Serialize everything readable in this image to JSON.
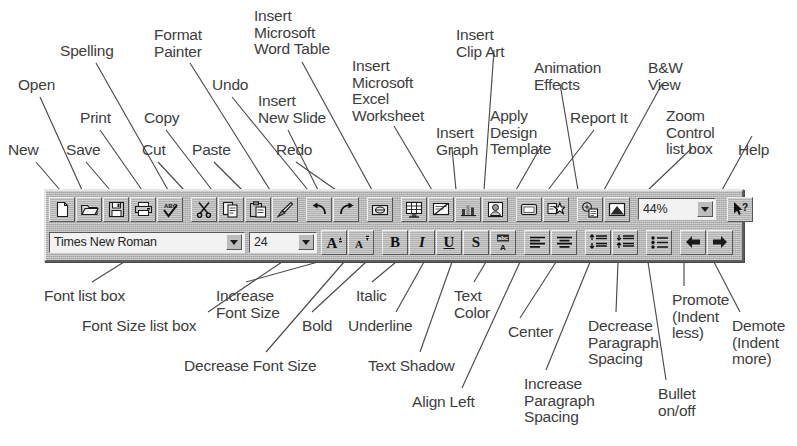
{
  "figure": {
    "line_color": "#4a4a4a",
    "text_color": "#3d3d3d",
    "toolbar_face": "#b9b9b9"
  },
  "callouts_top": [
    {
      "id": "new",
      "label": "New",
      "x": 8,
      "y": 142,
      "align": "left"
    },
    {
      "id": "open",
      "label": "Open",
      "x": 18,
      "y": 77,
      "align": "left"
    },
    {
      "id": "save",
      "label": "Save",
      "x": 66,
      "y": 142,
      "align": "left"
    },
    {
      "id": "print",
      "label": "Print",
      "x": 80,
      "y": 110,
      "align": "left"
    },
    {
      "id": "spelling",
      "label": "Spelling",
      "x": 60,
      "y": 43,
      "align": "left"
    },
    {
      "id": "cut",
      "label": "Cut",
      "x": 142,
      "y": 142,
      "align": "left"
    },
    {
      "id": "copy",
      "label": "Copy",
      "x": 144,
      "y": 110,
      "align": "left"
    },
    {
      "id": "paste",
      "label": "Paste",
      "x": 192,
      "y": 142,
      "align": "left"
    },
    {
      "id": "format-painter",
      "label": "Format\nPainter",
      "x": 154,
      "y": 27,
      "align": "left"
    },
    {
      "id": "undo",
      "label": "Undo",
      "x": 212,
      "y": 77,
      "align": "left"
    },
    {
      "id": "redo",
      "label": "Redo",
      "x": 276,
      "y": 142,
      "align": "left"
    },
    {
      "id": "insert-word-table",
      "label": "Insert\nMicrosoft\nWord Table",
      "x": 254,
      "y": 8,
      "align": "left"
    },
    {
      "id": "insert-new-slide",
      "label": "Insert\nNew Slide",
      "x": 258,
      "y": 93,
      "align": "left"
    },
    {
      "id": "insert-excel-sheet",
      "label": "Insert\nMicrosoft\nExcel\nWorksheet",
      "x": 352,
      "y": 58,
      "align": "left"
    },
    {
      "id": "insert-graph",
      "label": "Insert\nGraph",
      "x": 436,
      "y": 125,
      "align": "left"
    },
    {
      "id": "insert-clip-art",
      "label": "Insert\nClip Art",
      "x": 456,
      "y": 27,
      "align": "left"
    },
    {
      "id": "apply-design-template",
      "label": "Apply\nDesign\nTemplate",
      "x": 490,
      "y": 108,
      "align": "left"
    },
    {
      "id": "animation-effects",
      "label": "Animation\nEffects",
      "x": 534,
      "y": 60,
      "align": "left"
    },
    {
      "id": "report-it",
      "label": "Report It",
      "x": 570,
      "y": 110,
      "align": "left"
    },
    {
      "id": "bw-view",
      "label": "B&W\nView",
      "x": 648,
      "y": 60,
      "align": "left"
    },
    {
      "id": "zoom-control",
      "label": "Zoom\nControl\nlist box",
      "x": 666,
      "y": 108,
      "align": "left"
    },
    {
      "id": "help",
      "label": "Help",
      "x": 738,
      "y": 142,
      "align": "left"
    }
  ],
  "callouts_bottom": [
    {
      "id": "font-list-box",
      "label": "Font list box",
      "x": 44,
      "y": 288,
      "align": "left"
    },
    {
      "id": "font-size-list-box",
      "label": "Font Size list box",
      "x": 82,
      "y": 318,
      "align": "left"
    },
    {
      "id": "increase-font-size",
      "label": "Increase\nFont Size",
      "x": 216,
      "y": 288,
      "align": "left"
    },
    {
      "id": "decrease-font-size",
      "label": "Decrease Font Size",
      "x": 184,
      "y": 358,
      "align": "left"
    },
    {
      "id": "bold",
      "label": "Bold",
      "x": 302,
      "y": 318,
      "align": "left"
    },
    {
      "id": "italic",
      "label": "Italic",
      "x": 356,
      "y": 288,
      "align": "left"
    },
    {
      "id": "underline",
      "label": "Underline",
      "x": 348,
      "y": 318,
      "align": "left"
    },
    {
      "id": "text-shadow",
      "label": "Text Shadow",
      "x": 368,
      "y": 358,
      "align": "left"
    },
    {
      "id": "text-color",
      "label": "Text\nColor",
      "x": 454,
      "y": 288,
      "align": "left"
    },
    {
      "id": "align-left",
      "label": "Align Left",
      "x": 412,
      "y": 394,
      "align": "left"
    },
    {
      "id": "center",
      "label": "Center",
      "x": 508,
      "y": 324,
      "align": "left"
    },
    {
      "id": "increase-paragraph-spacing",
      "label": "Increase\nParagraph\nSpacing",
      "x": 524,
      "y": 376,
      "align": "left"
    },
    {
      "id": "decrease-paragraph-spacing",
      "label": "Decrease\nParagraph\nSpacing",
      "x": 588,
      "y": 318,
      "align": "left"
    },
    {
      "id": "bullet-on-off",
      "label": "Bullet\non/off",
      "x": 658,
      "y": 386,
      "align": "left"
    },
    {
      "id": "promote",
      "label": "Promote\n(Indent\nless)",
      "x": 672,
      "y": 292,
      "align": "left"
    },
    {
      "id": "demote",
      "label": "Demote\n(Indent\nmore)",
      "x": 732,
      "y": 318,
      "align": "left"
    }
  ],
  "leader_lines": [
    {
      "from": "new",
      "x1": 36,
      "y1": 162,
      "x2": 60,
      "y2": 190
    },
    {
      "from": "open",
      "x1": 40,
      "y1": 97,
      "x2": 82,
      "y2": 190
    },
    {
      "from": "save",
      "x1": 86,
      "y1": 162,
      "x2": 110,
      "y2": 190
    },
    {
      "from": "print",
      "x1": 100,
      "y1": 130,
      "x2": 142,
      "y2": 190
    },
    {
      "from": "spelling",
      "x1": 96,
      "y1": 63,
      "x2": 168,
      "y2": 190
    },
    {
      "from": "cut",
      "x1": 158,
      "y1": 162,
      "x2": 184,
      "y2": 190
    },
    {
      "from": "copy",
      "x1": 166,
      "y1": 130,
      "x2": 212,
      "y2": 190
    },
    {
      "from": "paste",
      "x1": 214,
      "y1": 162,
      "x2": 242,
      "y2": 190
    },
    {
      "from": "format-painter",
      "x1": 190,
      "y1": 63,
      "x2": 270,
      "y2": 190
    },
    {
      "from": "undo",
      "x1": 232,
      "y1": 97,
      "x2": 308,
      "y2": 190
    },
    {
      "from": "redo",
      "x1": 296,
      "y1": 162,
      "x2": 336,
      "y2": 190
    },
    {
      "from": "insert-word-table",
      "x1": 302,
      "y1": 62,
      "x2": 372,
      "y2": 190
    },
    {
      "from": "insert-new-slide",
      "x1": 288,
      "y1": 130,
      "x2": 318,
      "y2": 190
    },
    {
      "from": "insert-excel-sheet",
      "x1": 394,
      "y1": 126,
      "x2": 432,
      "y2": 190
    },
    {
      "from": "insert-graph",
      "x1": 452,
      "y1": 148,
      "x2": 456,
      "y2": 190
    },
    {
      "from": "insert-clip-art",
      "x1": 494,
      "y1": 50,
      "x2": 484,
      "y2": 190
    },
    {
      "from": "apply-design-template",
      "x1": 540,
      "y1": 148,
      "x2": 516,
      "y2": 190
    },
    {
      "from": "animation-effects",
      "x1": 560,
      "y1": 84,
      "x2": 578,
      "y2": 190
    },
    {
      "from": "report-it",
      "x1": 594,
      "y1": 130,
      "x2": 548,
      "y2": 190
    },
    {
      "from": "bw-view",
      "x1": 662,
      "y1": 84,
      "x2": 604,
      "y2": 190
    },
    {
      "from": "zoom-control",
      "x1": 692,
      "y1": 148,
      "x2": 648,
      "y2": 190
    },
    {
      "from": "help",
      "x1": 752,
      "y1": 136,
      "x2": 722,
      "y2": 190
    },
    {
      "from": "font-list-box",
      "x1": 92,
      "y1": 282,
      "x2": 124,
      "y2": 262
    },
    {
      "from": "font-size-list-box",
      "x1": 208,
      "y1": 312,
      "x2": 282,
      "y2": 262
    },
    {
      "from": "increase-font-size",
      "x1": 246,
      "y1": 282,
      "x2": 318,
      "y2": 262
    },
    {
      "from": "decrease-font-size",
      "x1": 266,
      "y1": 352,
      "x2": 344,
      "y2": 262
    },
    {
      "from": "bold",
      "x1": 312,
      "y1": 312,
      "x2": 366,
      "y2": 262
    },
    {
      "from": "italic",
      "x1": 372,
      "y1": 282,
      "x2": 396,
      "y2": 262
    },
    {
      "from": "underline",
      "x1": 396,
      "y1": 312,
      "x2": 424,
      "y2": 262
    },
    {
      "from": "text-shadow",
      "x1": 420,
      "y1": 352,
      "x2": 452,
      "y2": 262
    },
    {
      "from": "text-color",
      "x1": 474,
      "y1": 282,
      "x2": 486,
      "y2": 262
    },
    {
      "from": "align-left",
      "x1": 462,
      "y1": 388,
      "x2": 520,
      "y2": 262
    },
    {
      "from": "center",
      "x1": 520,
      "y1": 318,
      "x2": 556,
      "y2": 262
    },
    {
      "from": "increase-paragraph-spacing",
      "x1": 546,
      "y1": 370,
      "x2": 590,
      "y2": 262
    },
    {
      "from": "decrease-paragraph-spacing",
      "x1": 616,
      "y1": 312,
      "x2": 618,
      "y2": 262
    },
    {
      "from": "bullet-on-off",
      "x1": 666,
      "y1": 380,
      "x2": 648,
      "y2": 262
    },
    {
      "from": "promote",
      "x1": 684,
      "y1": 286,
      "x2": 684,
      "y2": 262
    },
    {
      "from": "demote",
      "x1": 740,
      "y1": 312,
      "x2": 714,
      "y2": 262
    }
  ],
  "toolbar": {
    "standard_row": {
      "buttons": [
        {
          "id": "new",
          "name": "new-icon",
          "title": "New"
        },
        {
          "id": "open",
          "name": "open-folder-icon",
          "title": "Open"
        },
        {
          "id": "save",
          "name": "save-floppy-icon",
          "title": "Save"
        },
        {
          "id": "print",
          "name": "printer-icon",
          "title": "Print"
        },
        {
          "id": "spelling",
          "name": "spelling-abc-check-icon",
          "title": "Spelling"
        },
        {
          "id": "cut",
          "name": "scissors-icon",
          "title": "Cut"
        },
        {
          "id": "copy",
          "name": "copy-pages-icon",
          "title": "Copy"
        },
        {
          "id": "paste",
          "name": "clipboard-paste-icon",
          "title": "Paste"
        },
        {
          "id": "format-painter",
          "name": "paintbrush-icon",
          "title": "Format Painter"
        },
        {
          "id": "undo",
          "name": "undo-arrow-icon",
          "title": "Undo"
        },
        {
          "id": "redo",
          "name": "redo-arrow-icon",
          "title": "Redo"
        },
        {
          "id": "insert-hyperlink",
          "name": "hyperlink-icon",
          "title": "Insert Hyperlink"
        },
        {
          "id": "insert-word-table",
          "name": "insert-word-table-icon",
          "title": "Insert Microsoft Word Table"
        },
        {
          "id": "insert-new-slide",
          "name": "insert-new-slide-icon",
          "title": "Insert New Slide"
        },
        {
          "id": "insert-graph",
          "name": "insert-graph-chart-icon",
          "title": "Insert Graph"
        },
        {
          "id": "insert-clip-art",
          "name": "insert-clip-art-icon",
          "title": "Insert Clip Art"
        },
        {
          "id": "apply-design-template",
          "name": "apply-design-template-icon",
          "title": "Apply Design Template"
        },
        {
          "id": "animation-effects",
          "name": "animation-effects-star-icon",
          "title": "Animation Effects"
        },
        {
          "id": "report-it",
          "name": "report-it-icon",
          "title": "Report It"
        },
        {
          "id": "bw-view",
          "name": "black-and-white-view-icon",
          "title": "B&W View"
        }
      ],
      "zoom_value": "44%",
      "help_button": {
        "name": "help-arrow-question-icon",
        "title": "Help"
      }
    },
    "formatting_row": {
      "font_name": "Times New Roman",
      "font_size": "24",
      "buttons": [
        {
          "id": "increase-font-size",
          "name": "increase-font-size-icon",
          "glyph": "A",
          "title": "Increase Font Size"
        },
        {
          "id": "decrease-font-size",
          "name": "decrease-font-size-icon",
          "glyph": "A",
          "title": "Decrease Font Size"
        },
        {
          "id": "bold",
          "name": "bold-icon",
          "glyph": "B",
          "title": "Bold"
        },
        {
          "id": "italic",
          "name": "italic-icon",
          "glyph": "I",
          "title": "Italic"
        },
        {
          "id": "underline",
          "name": "underline-icon",
          "glyph": "U",
          "title": "Underline"
        },
        {
          "id": "text-shadow",
          "name": "text-shadow-icon",
          "glyph": "S",
          "title": "Text Shadow"
        },
        {
          "id": "text-color",
          "name": "text-color-icon",
          "glyph": "A",
          "title": "Text Color"
        },
        {
          "id": "align-left",
          "name": "align-left-icon",
          "title": "Align Left"
        },
        {
          "id": "center",
          "name": "center-icon",
          "title": "Center"
        },
        {
          "id": "increase-paragraph-spacing",
          "name": "increase-paragraph-spacing-icon",
          "title": "Increase Paragraph Spacing"
        },
        {
          "id": "decrease-paragraph-spacing",
          "name": "decrease-paragraph-spacing-icon",
          "title": "Decrease Paragraph Spacing"
        },
        {
          "id": "bullet-on-off",
          "name": "bullet-list-icon",
          "title": "Bullet on/off"
        },
        {
          "id": "promote",
          "name": "promote-left-arrow-icon",
          "title": "Promote (Indent less)"
        },
        {
          "id": "demote",
          "name": "demote-right-arrow-icon",
          "title": "Demote (Indent more)"
        }
      ]
    }
  }
}
